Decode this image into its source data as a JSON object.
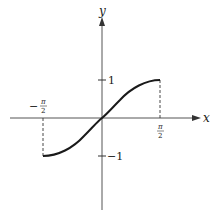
{
  "figure": {
    "function": "y = sin(x)",
    "domain_label": "[-π/2, π/2]",
    "axes": {
      "x_label": "x",
      "y_label": "y"
    },
    "tick_labels": {
      "y_pos": "1",
      "y_neg": "−1",
      "x_neg_num": "π",
      "x_neg_den": "2",
      "x_neg_sign": "−",
      "x_pos_num": "π",
      "x_pos_den": "2"
    },
    "colors": {
      "stroke": "#1a1a1a",
      "axis": "#555555",
      "background": "#ffffff"
    }
  }
}
